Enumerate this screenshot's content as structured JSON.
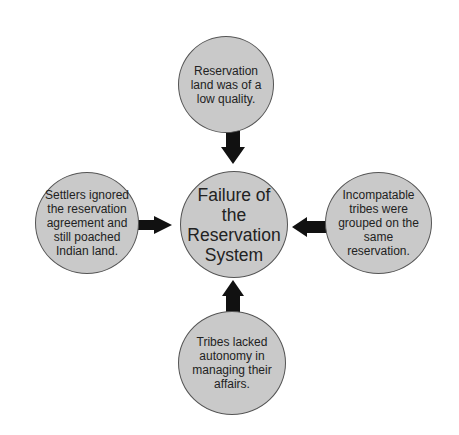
{
  "diagram": {
    "center": {
      "label": "Failure of the Reservation System"
    },
    "causes": [
      {
        "position": "top",
        "label": "Reservation land was of a low quality."
      },
      {
        "position": "left",
        "label": "Settlers ignored the reservation agreement and still poached Indian land."
      },
      {
        "position": "right",
        "label": "Incompatable tribes were grouped on the same reservation."
      },
      {
        "position": "bottom",
        "label": "Tribes lacked autonomy in managing their affairs."
      }
    ],
    "colors": {
      "node_fill": "#c9c9c9",
      "node_border": "#555555",
      "arrow": "#111111",
      "text": "#222222"
    }
  }
}
